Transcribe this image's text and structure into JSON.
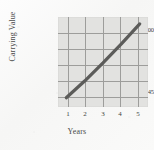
{
  "chart_data": {
    "type": "line",
    "title": "",
    "xlabel": "Years",
    "ylabel": "Carrying Value",
    "x": [
      1,
      2,
      3,
      4,
      5
    ],
    "values": [
      957345,
      967000,
      977500,
      988500,
      1000000
    ],
    "xtick_labels": [
      "1",
      "2",
      "3",
      "4",
      "5"
    ],
    "ytick_labels": [
      "$1,000,000",
      "$957,345"
    ],
    "ylim": [
      952000,
      1004000
    ],
    "xlim": [
      0.55,
      5.45
    ],
    "grid": true,
    "legend": "none",
    "series": [
      {
        "name": "Carrying Value",
        "values": [
          957345,
          967000,
          977500,
          988500,
          1000000
        ],
        "color": "#5c5c5a"
      }
    ],
    "annotations": []
  },
  "style": {
    "plot_background": "#e2e2e0",
    "gridline_color": "#9d9d9b",
    "line_color": "#5c5c5a",
    "page_background": "#fbfbfb",
    "text_color": "#3f3f3f"
  },
  "geometry": {
    "x_gridlines_pct": [
      11.1,
      30.6,
      50.0,
      69.4,
      88.9
    ],
    "y_gridlines_pct": [
      17.8,
      35.6,
      53.3,
      71.1,
      88.9
    ],
    "line_start_pct": {
      "x": 11.1,
      "y": 84.4
    },
    "line_end_pct": {
      "x": 88.9,
      "y": 17.8
    }
  }
}
